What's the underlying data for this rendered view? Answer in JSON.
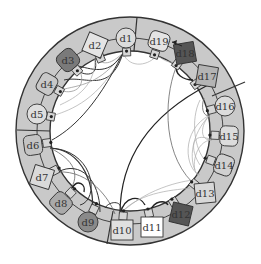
{
  "diagram": {
    "type": "circular-dependency-diagram",
    "center": [
      130,
      131
    ],
    "outer_radius": 114,
    "inner_radius": 80,
    "ring_color": "#c9c9c9",
    "ring_stroke": "#333333",
    "separators": [
      {
        "x1": 137,
        "y1": 17,
        "x2": 134,
        "y2": 51
      },
      {
        "x1": 245,
        "y1": 82,
        "x2": 212,
        "y2": 96
      },
      {
        "x1": 17,
        "y1": 130,
        "x2": 50,
        "y2": 131
      },
      {
        "x1": 107,
        "y1": 244,
        "x2": 113,
        "y2": 211
      }
    ],
    "nodes": [
      {
        "id": "d1",
        "label": "d1",
        "x": 126,
        "y": 38,
        "shape": "circle",
        "fill": "#dcdcdc"
      },
      {
        "id": "d2",
        "label": "d2",
        "x": 95,
        "y": 45,
        "shape": "diamond",
        "fill": "#e4e4e4"
      },
      {
        "id": "d3",
        "label": "d3",
        "x": 68,
        "y": 60,
        "shape": "octagon",
        "fill": "#7a7a7a"
      },
      {
        "id": "d4",
        "label": "d4",
        "x": 47,
        "y": 84,
        "shape": "rounded",
        "fill": "#c8c8c8"
      },
      {
        "id": "d5",
        "label": "d5",
        "x": 37,
        "y": 114,
        "shape": "circle",
        "fill": "#dedede"
      },
      {
        "id": "d6",
        "label": "d6",
        "x": 33,
        "y": 145,
        "shape": "rounded",
        "fill": "#c4c4c4"
      },
      {
        "id": "d7",
        "label": "d7",
        "x": 42,
        "y": 177,
        "shape": "diamond",
        "fill": "#dadada"
      },
      {
        "id": "d8",
        "label": "d8",
        "x": 61,
        "y": 203,
        "shape": "rounded",
        "fill": "#aaaaaa"
      },
      {
        "id": "d9",
        "label": "d9",
        "x": 88,
        "y": 222,
        "shape": "circle",
        "fill": "#8a8a8a"
      },
      {
        "id": "d10",
        "label": "d10",
        "x": 122,
        "y": 230,
        "shape": "square",
        "fill": "#e0e0e0"
      },
      {
        "id": "d11",
        "label": "d11",
        "x": 152,
        "y": 227,
        "shape": "square",
        "fill": "#ffffff"
      },
      {
        "id": "d12",
        "label": "d12",
        "x": 181,
        "y": 214,
        "shape": "diamond",
        "fill": "#555555"
      },
      {
        "id": "d13",
        "label": "d13",
        "x": 205,
        "y": 193,
        "shape": "diamond",
        "fill": "#d8d8d8"
      },
      {
        "id": "d14",
        "label": "d14",
        "x": 224,
        "y": 165,
        "shape": "rounded",
        "fill": "#d0d0d0"
      },
      {
        "id": "d15",
        "label": "d15",
        "x": 229,
        "y": 136,
        "shape": "rounded",
        "fill": "#dcdcdc"
      },
      {
        "id": "d16",
        "label": "d16",
        "x": 225,
        "y": 106,
        "shape": "circle",
        "fill": "#dcdcdc"
      },
      {
        "id": "d17",
        "label": "d17",
        "x": 207,
        "y": 76,
        "shape": "diamond",
        "fill": "#b4b4b4"
      },
      {
        "id": "d18",
        "label": "d18",
        "x": 185,
        "y": 53,
        "shape": "diamond",
        "fill": "#555555"
      },
      {
        "id": "d19",
        "label": "d19",
        "x": 159,
        "y": 41,
        "shape": "rounded",
        "fill": "#e4e4e4"
      }
    ],
    "edges": [
      {
        "d": "M123,53 C110,95 85,75 64,80",
        "w": 1.0,
        "c": "#333"
      },
      {
        "d": "M123,53 C100,85 80,85 60,90",
        "w": 0.8,
        "c": "#999"
      },
      {
        "d": "M123,53 C100,100 70,110 55,115",
        "w": 0.7,
        "c": "#aaa"
      },
      {
        "d": "M123,53 C95,110 70,130 52,140",
        "w": 1.0,
        "c": "#333"
      },
      {
        "d": "M123,53 C110,75 95,70 78,66",
        "w": 1.0,
        "c": "#333"
      },
      {
        "d": "M123,53 C105,70 100,60 95,59",
        "w": 0.8,
        "c": "#999"
      },
      {
        "d": "M123,53 C130,70 150,65 157,55",
        "w": 0.7,
        "c": "#aaa"
      },
      {
        "d": "M95,59 C100,80 80,75 75,68",
        "w": 1.0,
        "c": "#333"
      },
      {
        "d": "M95,59 C95,90 70,100 60,105",
        "w": 0.7,
        "c": "#aaa"
      },
      {
        "d": "M78,66 C90,90 70,95 60,90",
        "w": 0.8,
        "c": "#999"
      },
      {
        "d": "M157,55 C165,62 170,62 174,63",
        "w": 0.7,
        "c": "#aaa"
      },
      {
        "d": "M50,148 C95,150 100,200 80,205",
        "w": 1.0,
        "c": "#333"
      },
      {
        "d": "M50,148 C85,150 95,190 92,209",
        "w": 1.2,
        "c": "#333"
      },
      {
        "d": "M50,148 C75,160 80,175 70,190",
        "w": 0.8,
        "c": "#666"
      },
      {
        "d": "M58,172 C80,160 100,180 100,212",
        "w": 1.0,
        "c": "#333"
      },
      {
        "d": "M58,172 C90,170 110,200 115,214",
        "w": 0.8,
        "c": "#666"
      },
      {
        "d": "M72,188 C78,178 86,185 84,192",
        "w": 1.4,
        "c": "#222"
      },
      {
        "d": "M120,214 C120,150 160,110 208,85",
        "w": 1.2,
        "c": "#222"
      },
      {
        "d": "M120,214 C125,195 140,195 145,205",
        "w": 1.4,
        "c": "#222"
      },
      {
        "d": "M120,214 C150,185 190,180 195,180",
        "w": 0.7,
        "c": "#aaa"
      },
      {
        "d": "M120,214 C140,190 180,190 190,188",
        "w": 0.7,
        "c": "#aaa"
      },
      {
        "d": "M150,211 C155,200 165,200 168,205",
        "w": 1.4,
        "c": "#222"
      },
      {
        "d": "M120,214 C125,200 110,200 105,208",
        "w": 1.0,
        "c": "#333"
      },
      {
        "d": "M178,63 C165,90 160,150 192,182",
        "w": 0.8,
        "c": "#666"
      },
      {
        "d": "M178,63 C172,75 185,80 193,80",
        "w": 1.4,
        "c": "#222"
      },
      {
        "d": "M210,115 C180,130 185,170 200,175",
        "w": 0.7,
        "c": "#aaa"
      },
      {
        "d": "M210,115 C190,135 190,160 195,170",
        "w": 0.7,
        "c": "#aaa"
      },
      {
        "d": "M212,140 C190,130 190,150 200,165",
        "w": 0.7,
        "c": "#aaa"
      },
      {
        "d": "M212,140 C195,140 190,170 198,175",
        "w": 0.7,
        "c": "#aaa"
      },
      {
        "d": "M210,115 C200,125 200,140 210,140",
        "w": 0.7,
        "c": "#aaa"
      },
      {
        "d": "M200,100 C190,120 195,150 205,160",
        "w": 0.7,
        "c": "#aaa"
      },
      {
        "d": "M204,98 C200,110 205,118 210,115",
        "w": 0.8,
        "c": "#666"
      }
    ],
    "arrow": {
      "x1": 182,
      "y1": 46,
      "x2": 172,
      "y2": 42
    }
  }
}
